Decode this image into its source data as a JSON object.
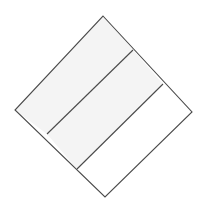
{
  "figure": {
    "title": "Rotated square partitioned into three parallel bands",
    "canvas": {
      "width": 205,
      "height": 206,
      "background": "#ffffff"
    },
    "stroke": {
      "color": "#4a4a4a",
      "width": 1.1,
      "linejoin": "miter",
      "linecap": "butt"
    },
    "outer_shape": {
      "name": "rotated-square",
      "vertices": [
        {
          "label": "top",
          "x": 103,
          "y": 16
        },
        {
          "label": "right",
          "x": 192,
          "y": 112
        },
        {
          "label": "bottom",
          "x": 105,
          "y": 197
        },
        {
          "label": "left",
          "x": 15,
          "y": 110
        }
      ],
      "points": "103,16 192,112 105,197 15,110"
    },
    "bands": [
      {
        "name": "band-upper-left",
        "fill": "#f4f4f4",
        "points": "103,16 133,50 47,134 15,110"
      },
      {
        "name": "band-middle",
        "fill": "#f4f4f4",
        "points": "133,50 163,84 77,169 47,134"
      },
      {
        "name": "band-lower-right",
        "fill": "#ffffff",
        "points": "163,84 192,112 105,197 77,169"
      }
    ],
    "divider_lines": [
      {
        "name": "divider-line-1",
        "x1": 133,
        "y1": 50,
        "x2": 47,
        "y2": 134
      },
      {
        "name": "divider-line-2",
        "x1": 163,
        "y1": 84,
        "x2": 77,
        "y2": 169
      }
    ]
  }
}
